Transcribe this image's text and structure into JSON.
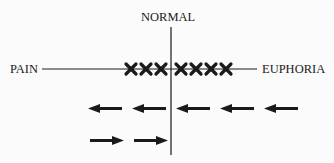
{
  "labels": {
    "top": "NORMAL",
    "left": "PAIN",
    "right": "EUPHORIA"
  },
  "diagram": {
    "x_marks_left_count": 3,
    "x_marks_right_count": 4,
    "row1_arrows": [
      "left",
      "left",
      "left",
      "left",
      "left"
    ],
    "row2_arrows": [
      "right",
      "right"
    ],
    "ink_color": "#1a1a1a"
  }
}
